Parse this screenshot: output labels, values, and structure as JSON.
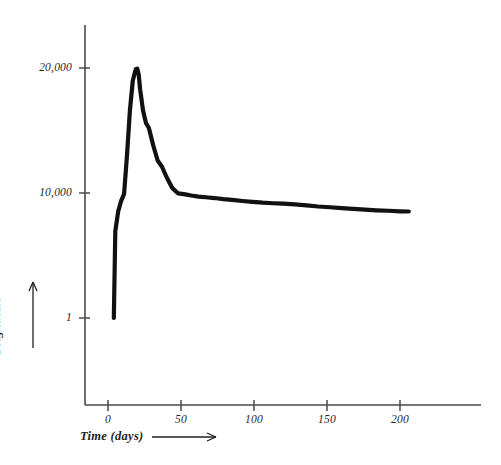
{
  "chart_data": {
    "type": "line",
    "title": "",
    "xlabel": "Time  (days)",
    "ylabel": "Brightness",
    "xlabel_arrow": true,
    "ylabel_arrow": true,
    "grid": false,
    "legend": "none",
    "yscale": "log-like",
    "xlim": [
      -5,
      255
    ],
    "ylim": [
      1,
      22000
    ],
    "x_ticks": [
      {
        "value": 0,
        "label": "0"
      },
      {
        "value": 50,
        "label": "50"
      },
      {
        "value": 100,
        "label": "100"
      },
      {
        "value": 150,
        "label": "150"
      },
      {
        "value": 200,
        "label": "200"
      }
    ],
    "y_ticks": [
      {
        "value": 1,
        "label": "1"
      },
      {
        "value": 10000,
        "label": "10,000"
      },
      {
        "value": 20000,
        "label": "20,000"
      }
    ],
    "series": [
      {
        "name": "light curve",
        "color": "#111111",
        "x": [
          4,
          5,
          7,
          9,
          11,
          13,
          15,
          17,
          19,
          20,
          21,
          22,
          24,
          26,
          28,
          31,
          34,
          37,
          40,
          44,
          48,
          52,
          57,
          62,
          67,
          73,
          79,
          85,
          92,
          99,
          106,
          113,
          120,
          128,
          136,
          144,
          152,
          160,
          168,
          176,
          184,
          192,
          200,
          206
        ],
        "y": [
          1,
          600,
          2600,
          5600,
          9200,
          13000,
          16600,
          19000,
          19900,
          19950,
          19500,
          18300,
          16600,
          15600,
          15200,
          13800,
          12600,
          12100,
          11300,
          10400,
          9700,
          9200,
          8300,
          7700,
          7300,
          6900,
          6350,
          6000,
          5550,
          5200,
          4900,
          4700,
          4560,
          4300,
          4000,
          3700,
          3500,
          3300,
          3100,
          2950,
          2800,
          2700,
          2600,
          2560
        ]
      }
    ]
  },
  "axes": {
    "x_axis_name": "time-axis",
    "y_axis_name": "brightness-axis"
  }
}
